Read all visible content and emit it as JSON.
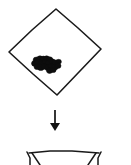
{
  "figure": {
    "type": "line-drawing-diagram",
    "background_color": "#ffffff",
    "ink_color": "#1a1a1a",
    "blob_color": "#0d0d0d",
    "caption": "",
    "steps": [
      {
        "id": "step-1",
        "name": "diamond-container-with-contents",
        "label": "",
        "shape": "diamond",
        "contents": "cluster-of-dark-round-objects"
      },
      {
        "id": "step-2",
        "name": "downward-arrow",
        "label": "",
        "shape": "arrow-down"
      },
      {
        "id": "step-3",
        "name": "second-container-partial",
        "label": "",
        "shape": "open-container-top",
        "note": "cropped at bottom edge"
      }
    ]
  },
  "geometry": {
    "diamond": {
      "top": [
        56,
        9
      ],
      "right": [
        101,
        49
      ],
      "bottom": [
        57,
        95
      ],
      "left": [
        9,
        52
      ]
    },
    "arrow": {
      "x": 55,
      "y_start": 110,
      "y_end": 131
    },
    "lower_shape": {
      "left_x": 27,
      "right_x": 101,
      "top_y": 152
    }
  },
  "blobs": {
    "count": 22,
    "cluster_center": [
      50,
      64
    ],
    "points": [
      [
        36.5,
        60.0,
        3.4
      ],
      [
        40.0,
        58.6,
        3.1
      ],
      [
        43.4,
        59.2,
        3.5
      ],
      [
        46.6,
        58.4,
        2.9
      ],
      [
        49.6,
        59.6,
        3.2
      ],
      [
        34.8,
        63.4,
        3.3
      ],
      [
        38.2,
        62.6,
        3.6
      ],
      [
        41.8,
        63.4,
        3.2
      ],
      [
        45.2,
        62.2,
        3.0
      ],
      [
        48.6,
        63.2,
        3.4
      ],
      [
        52.2,
        61.6,
        3.1
      ],
      [
        55.4,
        62.8,
        3.3
      ],
      [
        58.6,
        61.8,
        2.8
      ],
      [
        37.2,
        66.8,
        3.2
      ],
      [
        40.8,
        67.4,
        3.5
      ],
      [
        44.4,
        66.6,
        3.1
      ],
      [
        47.8,
        67.6,
        3.3
      ],
      [
        51.2,
        66.4,
        3.0
      ],
      [
        54.6,
        67.2,
        3.4
      ],
      [
        58.0,
        65.8,
        3.0
      ],
      [
        49.6,
        70.6,
        3.2
      ],
      [
        53.2,
        70.0,
        2.9
      ]
    ]
  }
}
